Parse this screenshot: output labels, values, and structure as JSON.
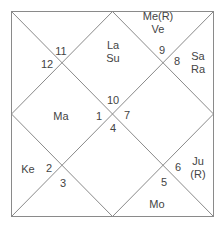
{
  "chart_style": "North Indian birth chart",
  "colors": {
    "line": "#8a8a8a",
    "text": "#444444",
    "background": "#ffffff"
  },
  "houses": [
    {
      "sign": "10",
      "planets": [
        "La",
        "Su"
      ]
    },
    {
      "sign": "9",
      "planets": [
        "Me(R)",
        "Ve"
      ]
    },
    {
      "sign": "8",
      "planets": [
        "Sa",
        "Ra"
      ]
    },
    {
      "sign": "7",
      "planets": []
    },
    {
      "sign": "6",
      "planets": [
        "Ju",
        "(R)"
      ]
    },
    {
      "sign": "5",
      "planets": [
        "Mo"
      ]
    },
    {
      "sign": "4",
      "planets": []
    },
    {
      "sign": "3",
      "planets": []
    },
    {
      "sign": "2",
      "planets": [
        "Ke"
      ]
    },
    {
      "sign": "1",
      "planets": [
        "Ma"
      ]
    },
    {
      "sign": "12",
      "planets": []
    },
    {
      "sign": "11",
      "planets": []
    }
  ]
}
